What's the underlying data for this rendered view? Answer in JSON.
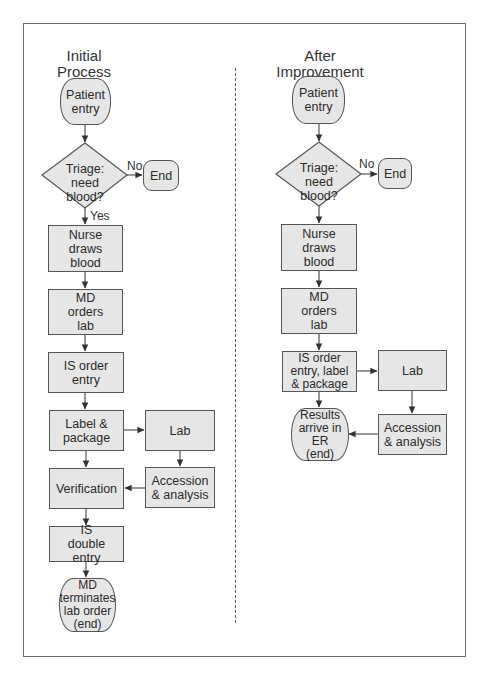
{
  "left": {
    "title": "Initial Process",
    "title_line1": "Initial",
    "title_line2": "Process",
    "nodes": {
      "patient_entry": "Patient entry",
      "triage": "Triage: need blood?",
      "end": "End",
      "nurse": "Nurse draws blood",
      "md_orders": "MD orders lab",
      "is_order": "IS order entry",
      "label_package": "Label & package",
      "lab": "Lab",
      "verification": "Verification",
      "accession": "Accession & analysis",
      "is_double": "IS double entry",
      "md_terminates": "MD terminates lab order (end)"
    },
    "edge_labels": {
      "no": "No",
      "yes": "Yes"
    }
  },
  "right": {
    "title": "After Improvement",
    "title_line1": "After",
    "title_line2": "Improvement",
    "nodes": {
      "patient_entry": "Patient entry",
      "triage": "Triage: need blood?",
      "end": "End",
      "nurse": "Nurse draws blood",
      "md_orders": "MD orders lab",
      "is_order_label": "IS order entry, label & package",
      "lab": "Lab",
      "results": "Results arrive in ER (end)",
      "accession": "Accession & analysis"
    },
    "edge_labels": {
      "no": "No"
    }
  },
  "colors": {
    "node_fill": "#e6e6e6",
    "stroke": "#555555"
  }
}
